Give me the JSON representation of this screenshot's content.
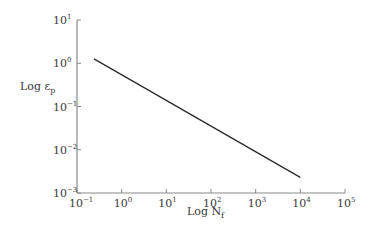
{
  "chart_data": {
    "type": "line",
    "title": "",
    "xlabel": "Log N_f",
    "ylabel": "Log ε_p",
    "xscale": "log",
    "yscale": "log",
    "xlim": [
      0.1,
      100000
    ],
    "ylim": [
      0.001,
      10
    ],
    "grid": false,
    "legend": null,
    "x_ticks": [
      "10^-1",
      "10^0",
      "10^1",
      "10^2",
      "10^3",
      "10^4",
      "10^5"
    ],
    "y_ticks": [
      "10^1",
      "10^0",
      "10^-1",
      "10^-2",
      "10^-3"
    ],
    "series": [
      {
        "name": "plastic strain vs cycles to failure",
        "x": [
          0.24,
          10000
        ],
        "y": [
          1.26,
          0.0023
        ]
      }
    ]
  },
  "labels": {
    "xlabel_main": "Log N",
    "xlabel_sub": "f",
    "ylabel_main": "Log ε",
    "ylabel_sub": "p"
  },
  "style": {
    "axis_color": "#8a8a8a",
    "line_color": "#2a2a2a",
    "text_color": "#3a3a3a"
  }
}
